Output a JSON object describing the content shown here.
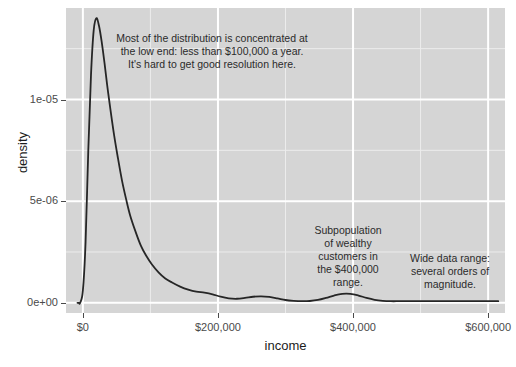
{
  "chart_data": {
    "type": "line",
    "title": "",
    "subtitle": "",
    "xlabel": "income",
    "ylabel": "density",
    "xlim": [
      -25000,
      625000
    ],
    "ylim": [
      -5e-07,
      1.45e-05
    ],
    "grid": true,
    "legend_position": "none",
    "x_ticks": [
      {
        "value": 0,
        "label": "$0"
      },
      {
        "value": 200000,
        "label": "$200,000"
      },
      {
        "value": 400000,
        "label": "$400,000"
      },
      {
        "value": 600000,
        "label": "$600,000"
      }
    ],
    "y_ticks": [
      {
        "value": 0.0,
        "label": "0e+00"
      },
      {
        "value": 5e-06,
        "label": "5e-06"
      },
      {
        "value": 1e-05,
        "label": "1e-05"
      }
    ],
    "x_minor_ticks": [
      -100000,
      100000,
      300000,
      500000
    ],
    "y_minor_ticks": [
      2.5e-06,
      7.5e-06,
      1.25e-05
    ],
    "series": [
      {
        "name": "income density",
        "color": "#262626",
        "line_width": 1.8,
        "x": [
          -8000,
          -7000,
          -6000,
          -4000,
          0,
          4000,
          8000,
          12000,
          16000,
          20000,
          24000,
          28000,
          32000,
          36000,
          40000,
          46000,
          52000,
          58000,
          64000,
          70000,
          78000,
          86000,
          94000,
          102000,
          112000,
          122000,
          132000,
          144000,
          156000,
          168000,
          180000,
          192000,
          204000,
          216000,
          228000,
          240000,
          252000,
          264000,
          276000,
          288000,
          300000,
          312000,
          324000,
          336000,
          348000,
          360000,
          372000,
          384000,
          396000,
          408000,
          420000,
          432000,
          444000,
          456000,
          468000,
          480000,
          492000,
          504000,
          520000,
          540000,
          560000,
          580000,
          600000,
          615000
        ],
        "y": [
          0.0,
          0.0,
          0.0,
          0.0,
          6e-07,
          3e-06,
          7.5e-06,
          1.12e-05,
          1.34e-05,
          1.4e-05,
          1.36e-05,
          1.28e-05,
          1.18e-05,
          1.07e-05,
          9.7e-06,
          8.3e-06,
          7.1e-06,
          6e-06,
          5.1e-06,
          4.3e-06,
          3.5e-06,
          2.8e-06,
          2.3e-06,
          1.9e-06,
          1.5e-06,
          1.2e-06,
          1e-06,
          8e-07,
          6.5e-07,
          5.5e-07,
          5e-07,
          4.2e-07,
          3e-07,
          2.2e-07,
          2e-07,
          2.4e-07,
          3e-07,
          3.2e-07,
          2.9e-07,
          2.2e-07,
          1.4e-07,
          1e-07,
          8e-08,
          9e-08,
          1.4e-07,
          2.4e-07,
          3.6e-07,
          4.4e-07,
          4.4e-07,
          3.6e-07,
          2.4e-07,
          1.5e-07,
          1e-07,
          8e-08,
          8e-08,
          8e-08,
          8e-08,
          8e-08,
          8e-08,
          8e-08,
          8e-08,
          8e-08,
          8e-08,
          8e-08
        ]
      }
    ],
    "annotations": [
      {
        "id": "annot-0",
        "text": "Most of the distribution is concentrated at\nthe low end: less than $100,000 a year.\nIt's hard to get good resolution here.",
        "x": 100000,
        "y": 1.28e-05
      },
      {
        "id": "annot-1",
        "text": "Subpopulation\nof wealthy\ncustomers in\nthe $400,000\nrange.",
        "x": 360000,
        "y": 3.8e-06
      },
      {
        "id": "annot-2",
        "text": "Wide data range:\nseveral orders of\nmagnitude.",
        "x": 520000,
        "y": 2.5e-06
      }
    ],
    "style": {
      "panel_background": "#d5d5d5",
      "major_gridline_color": "#ffffff",
      "minor_gridline_color": "#ececec",
      "line_color": "#262626",
      "text_color": "#1c1c1c",
      "tick_label_color": "#4a4a4a",
      "plot_background": "#ffffff"
    }
  }
}
